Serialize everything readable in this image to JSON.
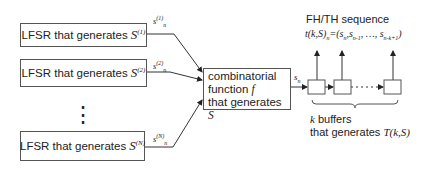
{
  "lfsr_boxes": [
    {
      "text": "LFSR that generates",
      "symbol": "S",
      "index": "(1)",
      "output_label": "s",
      "output_index": "(1)",
      "output_sub": "n"
    },
    {
      "text": "LFSR that generates",
      "symbol": "S",
      "index": "(2)",
      "output_label": "s",
      "output_index": "(2)",
      "output_sub": "n"
    },
    {
      "text": "LFSR that generates",
      "symbol": "S",
      "index": "(N)",
      "output_label": "s",
      "output_index": "(N)",
      "output_sub": "n"
    }
  ],
  "ellipsis": "⋮",
  "combinator": {
    "line1": "combinatorial",
    "line2": "function",
    "line2_var": "f",
    "line3": "that generates",
    "line3_var": "S"
  },
  "combinator_output": {
    "label": "s",
    "sub": "n"
  },
  "sequence": {
    "title": "FH/TH sequence",
    "formula_lhs": "t(k,S)",
    "formula_lhs_sub": "n",
    "formula_rhs": "=(s",
    "terms": [
      "n",
      "n-1",
      "n-k+1"
    ],
    "ellipsis": "…"
  },
  "buffers": {
    "count_var": "k",
    "line1": "buffers",
    "line2": "that generates",
    "line2_var": "T(k,S)",
    "dots": "· · · · ·"
  }
}
